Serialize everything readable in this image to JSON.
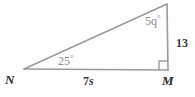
{
  "figure": {
    "kind": "right-triangle-diagram",
    "background_color": "#fdfdfd",
    "stroke_color": "#9a9a9a",
    "stroke_width": 1.6,
    "vertices": {
      "N": {
        "x": 24,
        "y": 69,
        "label": "N"
      },
      "M": {
        "x": 168,
        "y": 70,
        "label": "M"
      },
      "apex": {
        "x": 167,
        "y": 4,
        "label": ""
      }
    },
    "right_angle_marker": {
      "at_vertex": "M",
      "size": 8,
      "color": "#9a9a9a"
    }
  },
  "labels": {
    "vertex_n": "N",
    "vertex_m": "M",
    "side_bottom": "7s",
    "side_bottom_number": "7",
    "side_bottom_variable": "s",
    "side_right": "13",
    "angle_at_n": "25",
    "angle_at_n_full": "25°",
    "angle_at_apex_value": "5q",
    "angle_at_apex_number": "5",
    "angle_at_apex_variable": "q",
    "angle_at_apex_full": "5q°",
    "degree_symbol": "°"
  },
  "colors": {
    "stroke": "#9a9a9a",
    "vertex_text": "#2b2b2b",
    "side_text": "#3a3a3a",
    "angle_text": "#8e8e8e",
    "background": "#fdfdfd"
  }
}
